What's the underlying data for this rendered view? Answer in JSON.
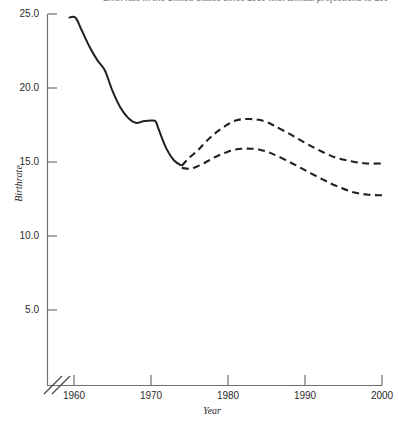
{
  "chart_data": {
    "type": "line",
    "title": "Birth rate in the United States since 1960 with annual projections to 2000",
    "subtitle": "",
    "xlabel": "Year",
    "ylabel": "Birthrate",
    "xlim": [
      1958,
      2000
    ],
    "ylim": [
      0,
      25
    ],
    "grid": false,
    "legend": "none",
    "axis_break_x": true,
    "axis_break_y": true,
    "y_ticks": [
      "5.0",
      "10.0",
      "15.0",
      "20.0",
      "25.0"
    ],
    "y_tick_values": [
      5.0,
      10.0,
      15.0,
      20.0,
      25.0
    ],
    "x_ticks": [
      "1960",
      "1970",
      "1980",
      "1990",
      "2000"
    ],
    "x_tick_values": [
      1960,
      1970,
      1980,
      1990,
      2000
    ],
    "series": [
      {
        "name": "Historical birthrate",
        "style": "solid",
        "color": "#231f20",
        "x": [
          1959.3,
          1960.2,
          1961,
          1962,
          1963,
          1964,
          1965,
          1966,
          1967,
          1968,
          1969,
          1970,
          1970.6,
          1971,
          1972,
          1973,
          1974
        ],
        "values": [
          24.75,
          24.75,
          23.9,
          22.8,
          21.9,
          21.2,
          19.8,
          18.7,
          18.0,
          17.65,
          17.75,
          17.8,
          17.75,
          17.2,
          15.9,
          15.1,
          14.75
        ]
      },
      {
        "name": "High projection",
        "style": "dashed",
        "color": "#231f20",
        "x": [
          1974,
          1975,
          1976,
          1977,
          1978,
          1979,
          1980,
          1981,
          1982,
          1983,
          1984,
          1985,
          1986,
          1988,
          1990,
          1992,
          1994,
          1996,
          1998,
          2000
        ],
        "values": [
          14.75,
          15.3,
          15.75,
          16.3,
          16.8,
          17.2,
          17.55,
          17.8,
          17.9,
          17.9,
          17.85,
          17.7,
          17.45,
          16.9,
          16.3,
          15.75,
          15.3,
          15.05,
          14.9,
          14.9
        ]
      },
      {
        "name": "Low projection",
        "style": "dashed",
        "color": "#231f20",
        "x": [
          1974,
          1975,
          1976,
          1977,
          1978,
          1979,
          1980,
          1981,
          1982,
          1983,
          1984,
          1985,
          1986,
          1988,
          1990,
          1992,
          1994,
          1996,
          1998,
          2000
        ],
        "values": [
          14.6,
          14.55,
          14.7,
          14.95,
          15.25,
          15.5,
          15.7,
          15.85,
          15.9,
          15.9,
          15.85,
          15.7,
          15.5,
          15.0,
          14.45,
          13.9,
          13.4,
          13.0,
          12.8,
          12.75
        ]
      }
    ]
  }
}
